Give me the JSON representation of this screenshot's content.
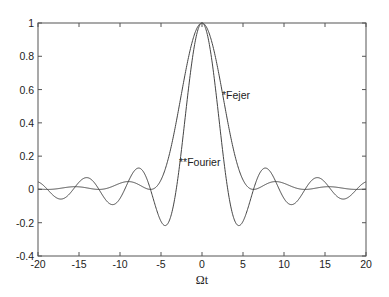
{
  "chart_data": {
    "type": "line",
    "title": "",
    "xlabel": "Ωt",
    "ylabel": "",
    "xlim": [
      -20,
      20
    ],
    "ylim": [
      -0.4,
      1
    ],
    "grid": false,
    "legend": "none (inline annotations)",
    "x_ticks": [
      -20,
      -15,
      -10,
      -5,
      0,
      5,
      10,
      15,
      20
    ],
    "x_tick_labels": [
      "-20",
      "-15",
      "-10",
      "-5",
      "0",
      "5",
      "10",
      "15",
      "20"
    ],
    "y_ticks": [
      -0.4,
      -0.2,
      0,
      0.2,
      0.4,
      0.6,
      0.8,
      1
    ],
    "y_tick_labels": [
      "-0.4",
      "-0.2",
      "0",
      "0.2",
      "0.4",
      "0.6",
      "0.8",
      "1"
    ],
    "annotations": [
      {
        "text": "*Fejer",
        "x": 2.7,
        "y": 0.56
      },
      {
        "text": "**Fourier",
        "x": -2.6,
        "y": 0.16
      }
    ],
    "series": [
      {
        "name": "Fourier",
        "description": "sin(Ωt)/(Ωt)",
        "x": [
          -20,
          -17.5,
          -15,
          -14.1,
          -12.5,
          -10,
          -7.7,
          -6.28,
          -5,
          -4.49,
          -3.14,
          -2,
          -1,
          0,
          1,
          2,
          3.14,
          4.49,
          5,
          6.28,
          7.7,
          10,
          12.5,
          14.1,
          15,
          17.5,
          20
        ],
        "values": [
          0.05,
          -0.06,
          0.04,
          0.07,
          -0.01,
          -0.05,
          0.13,
          0.0,
          -0.19,
          -0.22,
          0.0,
          0.45,
          0.84,
          1.0,
          0.84,
          0.45,
          0.0,
          -0.22,
          -0.19,
          0.0,
          0.13,
          -0.05,
          -0.01,
          0.07,
          0.04,
          -0.06,
          0.05
        ]
      },
      {
        "name": "Fejer",
        "description": "[sin(Ωt/2)/(Ωt/2)]^2",
        "x": [
          -20,
          -18.85,
          -15.5,
          -12.57,
          -9,
          -6.28,
          -3,
          -2,
          -1,
          0,
          1,
          2,
          3,
          6.28,
          9,
          12.57,
          15.5,
          18.85,
          20
        ],
        "values": [
          0.0,
          0.0,
          0.02,
          0.0,
          0.05,
          0.0,
          0.44,
          0.71,
          0.92,
          1.0,
          0.92,
          0.71,
          0.44,
          0.0,
          0.05,
          0.0,
          0.02,
          0.0,
          0.0
        ]
      }
    ]
  },
  "labels": {
    "xlabel": "Ωt",
    "fejer": "*Fejer",
    "fourier": "**Fourier"
  },
  "colors": {
    "axis": "#555555",
    "line": "#444444",
    "text": "#222222"
  }
}
